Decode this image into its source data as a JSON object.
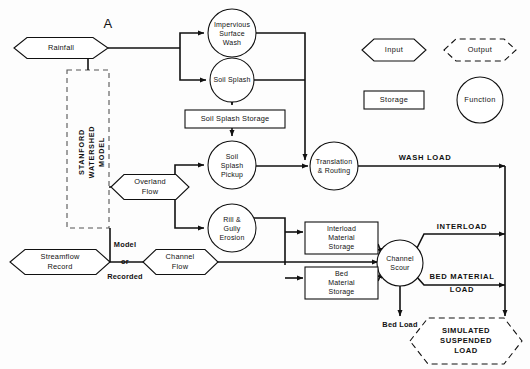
{
  "figure": {
    "panel_label": "A"
  },
  "inputs": [
    {
      "id": "rainfall",
      "label": "Rainfall",
      "shape": "input-hexagon",
      "cx": 60,
      "cy": 48,
      "w": 92,
      "h": 21
    },
    {
      "id": "streamflow_record",
      "label_line1": "Streamflow",
      "label_line2": "Record",
      "shape": "input-hexagon",
      "cx": 60,
      "cy": 262,
      "w": 100,
      "h": 25
    },
    {
      "id": "overland_flow",
      "label_line1": "Overland",
      "label_line2": "Flow",
      "shape": "input-hexagon",
      "cx": 150,
      "cy": 187,
      "w": 78,
      "h": 25
    },
    {
      "id": "channel_flow",
      "label_line1": "Channel",
      "label_line2": "Flow",
      "shape": "input-hexagon",
      "cx": 180,
      "cy": 262,
      "w": 76,
      "h": 25
    }
  ],
  "functions": [
    {
      "id": "impervious_surface_wash",
      "lines": [
        "Impervious",
        "Surface",
        "Wash"
      ],
      "cx": 232,
      "cy": 33,
      "r": 24
    },
    {
      "id": "soil_splash",
      "lines": [
        "Soil Splash"
      ],
      "cx": 232,
      "cy": 80,
      "r": 22
    },
    {
      "id": "soil_splash_pickup",
      "lines": [
        "Soil",
        "Splash",
        "Pickup"
      ],
      "cx": 232,
      "cy": 165,
      "r": 24
    },
    {
      "id": "rill_gully_erosion",
      "lines": [
        "Rill &",
        "Gully",
        "Erosion"
      ],
      "cx": 232,
      "cy": 228,
      "r": 24
    },
    {
      "id": "translation_routing",
      "lines": [
        "Translation",
        "& Routing"
      ],
      "cx": 334,
      "cy": 166,
      "r": 24
    },
    {
      "id": "channel_scour",
      "lines": [
        "Channel",
        "Scour"
      ],
      "cx": 400,
      "cy": 263,
      "r": 23
    }
  ],
  "storages": [
    {
      "id": "soil_splash_storage",
      "lines": [
        "Soil Splash Storage"
      ],
      "x": 185,
      "y": 110,
      "w": 100,
      "h": 18
    },
    {
      "id": "interload_material_storage",
      "lines": [
        "Interload",
        "Material",
        "Storage"
      ],
      "x": 305,
      "y": 222,
      "w": 73,
      "h": 32
    },
    {
      "id": "bed_material_storage",
      "lines": [
        "Bed",
        "Material",
        "Storage"
      ],
      "x": 305,
      "y": 267,
      "w": 73,
      "h": 32
    }
  ],
  "outputs": [
    {
      "id": "simulated_suspended_load",
      "lines": [
        "SIMULATED",
        "SUSPENDED",
        "LOAD"
      ],
      "cx": 466,
      "cy": 341,
      "w": 112,
      "h": 46
    }
  ],
  "group_box": {
    "id": "stanford_watershed_model",
    "label": "STANFORD WATERSHED MODEL",
    "label_line1": "STANFORD",
    "label_line2": "WATERSHED",
    "label_line3": "MODEL",
    "x": 67,
    "y": 70,
    "w": 42,
    "h": 158
  },
  "edge_labels": {
    "wash_load": "WASH LOAD",
    "interload": "INTERLOAD",
    "bed_material_load_line1": "BED MATERIAL",
    "bed_material_load_line2": "LOAD",
    "bed_load": "Bed Load",
    "model": "Model",
    "or": "or",
    "recorded": "Recorded"
  },
  "legend": {
    "items": [
      {
        "id": "legend-input",
        "label": "Input",
        "shape": "hexagon-solid",
        "cx": 394,
        "cy": 50,
        "w": 64,
        "h": 22
      },
      {
        "id": "legend-output",
        "label": "Output",
        "shape": "hexagon-dashed",
        "cx": 480,
        "cy": 50,
        "w": 72,
        "h": 22
      },
      {
        "id": "legend-storage",
        "label": "Storage",
        "shape": "rectangle",
        "cx": 394,
        "cy": 100,
        "w": 60,
        "h": 18
      },
      {
        "id": "legend-function",
        "label": "Function",
        "shape": "circle",
        "cx": 480,
        "cy": 100,
        "r": 23
      }
    ]
  },
  "colors": {
    "stroke": "#111111",
    "group_stroke": "#555555",
    "background": "#fdfdfd",
    "shape_fill": "#ffffff"
  }
}
